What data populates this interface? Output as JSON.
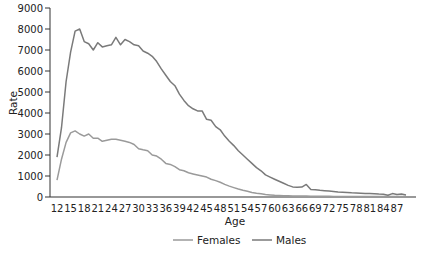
{
  "chart_data": {
    "type": "line",
    "title": "",
    "xlabel": "Age",
    "ylabel": "Rate",
    "ylim": [
      0,
      9000
    ],
    "xlim": [
      12,
      90
    ],
    "grid": false,
    "legend_position": "bottom",
    "y_ticks": [
      0,
      1000,
      2000,
      3000,
      4000,
      5000,
      6000,
      7000,
      8000,
      9000
    ],
    "x_ticks": [
      12,
      15,
      18,
      21,
      24,
      27,
      30,
      33,
      36,
      39,
      42,
      45,
      48,
      51,
      54,
      57,
      60,
      63,
      66,
      69,
      72,
      75,
      78,
      81,
      84,
      87
    ],
    "x": [
      12,
      13,
      14,
      15,
      16,
      17,
      18,
      19,
      20,
      21,
      22,
      23,
      24,
      25,
      26,
      27,
      28,
      29,
      30,
      31,
      32,
      33,
      34,
      35,
      36,
      37,
      38,
      39,
      40,
      41,
      42,
      43,
      44,
      45,
      46,
      47,
      48,
      49,
      50,
      51,
      52,
      53,
      54,
      55,
      56,
      57,
      58,
      59,
      60,
      61,
      62,
      63,
      64,
      65,
      66,
      67,
      68,
      69,
      70,
      71,
      72,
      73,
      74,
      75,
      76,
      77,
      78,
      79,
      80,
      81,
      82,
      83,
      84,
      85,
      86,
      87,
      88,
      89
    ],
    "series": [
      {
        "name": "Females",
        "color": "#9a9a9a",
        "values": [
          800,
          1800,
          2600,
          3050,
          3150,
          3000,
          2900,
          3000,
          2800,
          2800,
          2650,
          2700,
          2750,
          2750,
          2700,
          2650,
          2600,
          2500,
          2300,
          2250,
          2200,
          2000,
          1950,
          1800,
          1600,
          1550,
          1450,
          1300,
          1250,
          1150,
          1100,
          1050,
          1000,
          950,
          850,
          780,
          700,
          600,
          520,
          450,
          380,
          320,
          270,
          220,
          180,
          150,
          120,
          100,
          80,
          70,
          60,
          55,
          50,
          48,
          45,
          42,
          40,
          38,
          36,
          34,
          32,
          30,
          30,
          28,
          27,
          26,
          25,
          24,
          23,
          22,
          22,
          21,
          20,
          20,
          20,
          20,
          20,
          20
        ]
      },
      {
        "name": "Males",
        "color": "#7a7a7a",
        "values": [
          1900,
          3300,
          5500,
          6900,
          7900,
          8000,
          7400,
          7300,
          7000,
          7350,
          7150,
          7200,
          7250,
          7600,
          7250,
          7500,
          7400,
          7250,
          7200,
          6950,
          6850,
          6700,
          6450,
          6100,
          5800,
          5500,
          5300,
          4900,
          4600,
          4350,
          4200,
          4100,
          4100,
          3700,
          3650,
          3350,
          3200,
          2900,
          2650,
          2450,
          2200,
          2000,
          1800,
          1600,
          1400,
          1250,
          1050,
          950,
          850,
          750,
          650,
          550,
          480,
          460,
          470,
          600,
          360,
          350,
          320,
          300,
          280,
          260,
          240,
          230,
          220,
          200,
          190,
          180,
          170,
          160,
          150,
          140,
          130,
          80,
          160,
          120,
          140,
          100
        ]
      }
    ]
  },
  "axis": {
    "x_label": "Age",
    "y_label": "Rate"
  },
  "legend": {
    "items": [
      {
        "label": "Females"
      },
      {
        "label": "Males"
      }
    ]
  }
}
